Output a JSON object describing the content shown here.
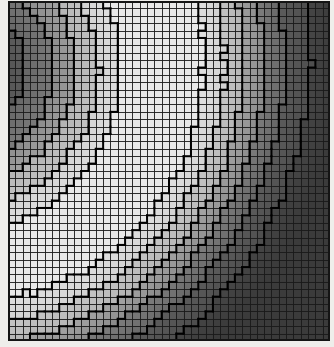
{
  "figure": {
    "title": "",
    "background_color": "#efeeeb",
    "plot_background_color": "#3a3a3a",
    "gridline_color": "#1a1a1a",
    "contour_line_color": "#000000"
  },
  "plot": {
    "left": 8,
    "top": 1,
    "width": 322,
    "height": 340,
    "cols": 44,
    "rows": 46,
    "cell_width": 7.32,
    "cell_height": 7.39
  },
  "chart_data": {
    "type": "heatmap",
    "title": "",
    "xlabel": "",
    "ylabel": "",
    "grid": true,
    "legend": "none",
    "colormap": "gray",
    "shading": "flat",
    "contour_overlay": true,
    "x": [
      0,
      44
    ],
    "y": [
      0,
      46
    ],
    "xlim": [
      0,
      44
    ],
    "ylim": [
      0,
      46
    ],
    "zlim": [
      0,
      1
    ],
    "levels": [
      0.12,
      0.28,
      0.44,
      0.6,
      0.76,
      0.9
    ],
    "level_colors": [
      "#3b3b3b",
      "#4e4e4e",
      "#676767",
      "#8b8b8b",
      "#b4b4b4",
      "#d2d2d2",
      "#e8e8e8"
    ],
    "field_model": {
      "kind": "ridge",
      "center_x": -6.0,
      "center_y": 9.0,
      "radius": 27.5,
      "sigma": 11.0,
      "amplitude": 1.0,
      "baseline": 0.07,
      "tilt_x": -0.0042,
      "tilt_y": -0.003,
      "noise": 0.018
    }
  }
}
